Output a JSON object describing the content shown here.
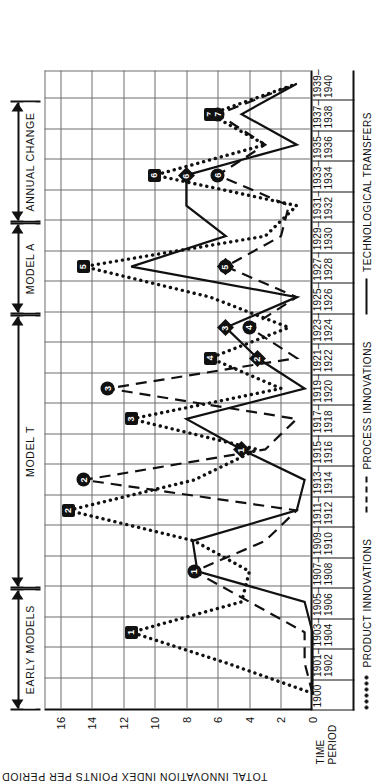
{
  "chart_data": {
    "type": "line",
    "title": "",
    "xlabel": "TIME PERIOD",
    "ylabel": "TOTAL INNOVATION INDEX POINTS PER PERIOD",
    "ylim": [
      0,
      17
    ],
    "yticks": [
      0,
      2,
      4,
      6,
      8,
      10,
      12,
      14,
      16
    ],
    "grid": true,
    "legend_position": "bottom",
    "categories": [
      "1900",
      "1901–\n1902",
      "1903–\n1904",
      "1905–\n1906",
      "1907–\n1908",
      "1909–\n1910",
      "1911–\n1912",
      "1913–\n1914",
      "1915–\n1916",
      "1917–\n1918",
      "1919–\n1920",
      "1921–\n1922",
      "1923–\n1924",
      "1925–\n1926",
      "1927–\n1928",
      "1929–\n1930",
      "1931–\n1932",
      "1933–\n1934",
      "1935–\n1936",
      "1937–\n1938",
      "1939–\n1940"
    ],
    "series": [
      {
        "name": "PRODUCT INNOVATIONS",
        "style": "dotted",
        "values": [
          0,
          5.5,
          11.5,
          4.5,
          4.0,
          7.5,
          15.5,
          7.5,
          3.5,
          11.5,
          2.0,
          6.5,
          1.5,
          6.5,
          14.5,
          3.0,
          1.0,
          10.0,
          3.0,
          6.5,
          1.0
        ]
      },
      {
        "name": "PROCESS INNOVATIONS",
        "style": "dashed",
        "values": [
          0,
          0.5,
          0.5,
          4.0,
          7.5,
          3.0,
          1.0,
          14.5,
          3.0,
          1.0,
          13.0,
          1.0,
          4.0,
          1.0,
          5.5,
          2.0,
          1.5,
          6.0,
          3.0,
          6.0,
          1.0
        ]
      },
      {
        "name": "TECHNOLOGICAL TRANSFERS",
        "style": "solid",
        "values": [
          0,
          0,
          0,
          0.5,
          7.3,
          7.6,
          1.0,
          0.5,
          4.5,
          8.0,
          0.5,
          3.5,
          5.5,
          1.0,
          11.5,
          5.5,
          8.0,
          8.0,
          1.0,
          4.5,
          1.0
        ]
      }
    ],
    "marker_annotations": {
      "square_numbers": [
        {
          "label": "1",
          "category_index": 2,
          "value": 11.5
        },
        {
          "label": "2",
          "category_index": 6,
          "value": 15.5
        },
        {
          "label": "3",
          "category_index": 9,
          "value": 11.5
        },
        {
          "label": "4",
          "category_index": 11,
          "value": 6.5
        },
        {
          "label": "5",
          "category_index": 14,
          "value": 14.5
        },
        {
          "label": "6",
          "category_index": 17,
          "value": 10.0
        },
        {
          "label": "7",
          "category_index": 19,
          "value": 6.5
        }
      ],
      "circle_numbers": [
        {
          "label": "1",
          "category_index": 4,
          "value": 7.5
        },
        {
          "label": "2",
          "category_index": 7,
          "value": 14.5
        },
        {
          "label": "3",
          "category_index": 10,
          "value": 13.0
        },
        {
          "label": "4",
          "category_index": 12,
          "value": 4.0
        },
        {
          "label": "5",
          "category_index": 14,
          "value": 5.5
        },
        {
          "label": "6",
          "category_index": 17,
          "value": 6.0
        },
        {
          "label": "7",
          "category_index": 19,
          "value": 6.0
        }
      ],
      "diamond_numbers": [
        {
          "label": "1",
          "category_index": 8,
          "value": 4.5
        },
        {
          "label": "2",
          "category_index": 11,
          "value": 3.5
        },
        {
          "label": "3",
          "category_index": 12,
          "value": 5.5
        },
        {
          "label": "4",
          "category_index": 14,
          "value": 5.5
        },
        {
          "label": "5",
          "category_index": 14,
          "value": 5.5
        },
        {
          "label": "6",
          "category_index": 17,
          "value": 8.0
        }
      ]
    },
    "eras": [
      {
        "label": "EARLY MODELS",
        "start_index": 0,
        "end_index": 4
      },
      {
        "label": "MODEL T",
        "start_index": 4,
        "end_index": 13
      },
      {
        "label": "MODEL A",
        "start_index": 13,
        "end_index": 16
      },
      {
        "label": "ANNUAL CHANGE",
        "start_index": 16,
        "end_index": 20
      }
    ]
  },
  "axis": {
    "y_title": "TOTAL INNOVATION INDEX POINTS PER PERIOD",
    "x_title_line1": "TIME",
    "x_title_line2": "PERIOD"
  },
  "legend": {
    "items": [
      {
        "label": "PRODUCT INNOVATIONS",
        "style": "dotted"
      },
      {
        "label": "PROCESS INNOVATIONS",
        "style": "dashed"
      },
      {
        "label": "TECHNOLOGICAL TRANSFERS",
        "style": "solid"
      }
    ]
  },
  "colors": {
    "ink": "#111111",
    "grid": "#6f6f6f",
    "paper": "#ffffff"
  }
}
